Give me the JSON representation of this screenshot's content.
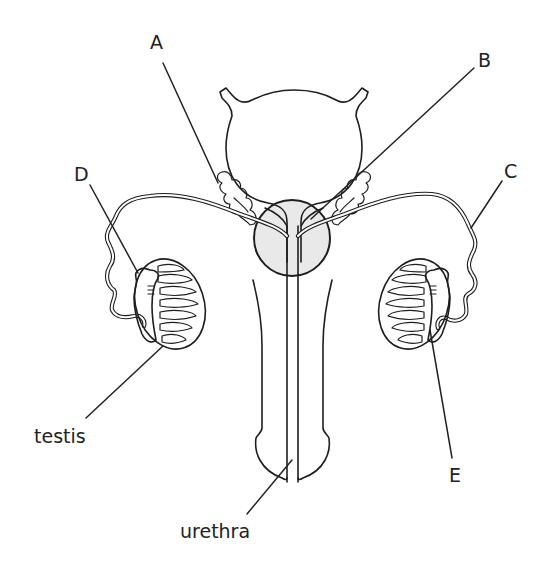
{
  "diagram": {
    "labels": {
      "A": "A",
      "B": "B",
      "C": "C",
      "D": "D",
      "E": "E",
      "testis": "testis",
      "urethra": "urethra"
    },
    "colors": {
      "ink": "#1e1e1e",
      "prostate_fill": "#e9e9e9",
      "background": "#ffffff"
    },
    "structures": [
      {
        "id": "bladder",
        "label": ""
      },
      {
        "id": "seminal-vesicle-left",
        "pointer": "A"
      },
      {
        "id": "prostate-gland",
        "pointer": "B"
      },
      {
        "id": "sperm-duct-right",
        "pointer": "C"
      },
      {
        "id": "epididymis-left",
        "pointer": "D"
      },
      {
        "id": "testis-right",
        "pointer": "E"
      },
      {
        "id": "testis-left",
        "pointer": "testis"
      },
      {
        "id": "urethra",
        "pointer": "urethra"
      },
      {
        "id": "penis",
        "label": ""
      }
    ]
  }
}
